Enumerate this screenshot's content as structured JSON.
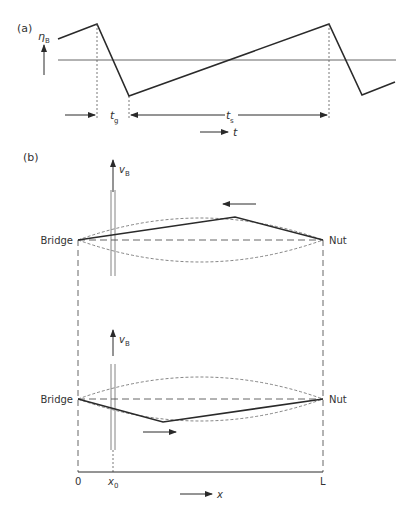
{
  "panel_a": {
    "label": "(a)",
    "y_symbol": "η",
    "y_sub": "B",
    "tg_symbol": "t",
    "tg_sub": "g",
    "ts_symbol": "t",
    "ts_sub": "s",
    "time_axis_label": "t"
  },
  "panel_b": {
    "label": "(b)",
    "upper": {
      "velocity_symbol": "v",
      "velocity_sub": "B",
      "left_label": "Bridge",
      "right_label": "Nut",
      "motion_direction": "left"
    },
    "lower": {
      "velocity_symbol": "v",
      "velocity_sub": "B",
      "left_label": "Bridge",
      "right_label": "Nut",
      "motion_direction": "right"
    },
    "axis": {
      "origin_label": "0",
      "x0_symbol": "x",
      "x0_sub": "0",
      "end_label": "L",
      "x_axis_label": "x"
    }
  },
  "colors": {
    "line": "#2a2a2a",
    "dashed": "#555555",
    "text": "#333333"
  }
}
